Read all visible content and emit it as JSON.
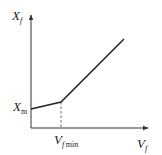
{
  "diagram": {
    "type": "piecewise-linear-graph",
    "y_axis": {
      "symbol": "X",
      "subscript": "f"
    },
    "x_axis": {
      "symbol": "V",
      "subscript": "f"
    },
    "y_intercept_label": {
      "symbol": "X",
      "subscript": "m"
    },
    "breakpoint_label": {
      "symbol": "V",
      "subscript": "f",
      "subscript2": "min"
    },
    "colors": {
      "line": "#222222",
      "axis": "#333333",
      "dashed": "#444444"
    },
    "segments": [
      {
        "name": "low-slope",
        "from": [
          31,
          109
        ],
        "to": [
          61,
          102
        ]
      },
      {
        "name": "high-slope",
        "from": [
          61,
          102
        ],
        "to": [
          124,
          39
        ]
      }
    ]
  }
}
